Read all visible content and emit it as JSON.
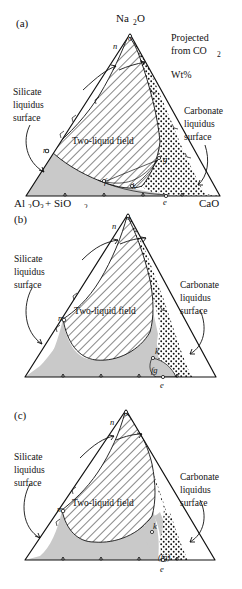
{
  "figure": {
    "type": "ternary-phase-diagram-series",
    "panel_count": 3
  },
  "notes": {
    "projected_line1": "Projected",
    "projected_line2": "from CO",
    "projected_sub": "2",
    "units": "Wt%"
  },
  "labels": {
    "silicate_l1": "Silicate",
    "silicate_l2": "liquidus",
    "silicate_l3": "surface",
    "carbonate_l1": "Carbonate",
    "carbonate_l2": "liquidus",
    "carbonate_l3": "surface",
    "two_liquid": "Two-liquid field"
  },
  "apex": {
    "top_main": "Na",
    "top_sub": "2",
    "top_tail": "O",
    "left_main": "Al",
    "left_sub1": "2",
    "left_mid": "O",
    "left_sub2": "3",
    "left_plus": "+ SiO",
    "left_sub3": "2",
    "right": "CaO"
  },
  "panels": [
    {
      "id": "a",
      "tag": "(a)",
      "has_apex_labels": true,
      "has_corner_labels": true,
      "has_notes": true,
      "points": [
        {
          "name": "o",
          "text": "o",
          "x": 128,
          "y": 41
        },
        {
          "name": "n",
          "text": "n",
          "x": 118,
          "y": 47
        },
        {
          "name": "m",
          "text": "m",
          "x": 47,
          "y": 151
        },
        {
          "name": "f",
          "text": "f",
          "x": 107,
          "y": 183
        },
        {
          "name": "g",
          "text": "g",
          "x": 164,
          "y": 163
        },
        {
          "name": "k",
          "text": "k",
          "x": 134,
          "y": 188
        },
        {
          "name": "e",
          "text": "e",
          "x": 165,
          "y": 198
        }
      ]
    },
    {
      "id": "b",
      "tag": "(b)",
      "has_apex_labels": false,
      "has_corner_labels": false,
      "has_notes": false,
      "points": [
        {
          "name": "o",
          "text": "o",
          "x": 126,
          "y": 20
        },
        {
          "name": "n",
          "text": "n",
          "x": 116,
          "y": 27
        },
        {
          "name": "m",
          "text": "m",
          "x": 63,
          "y": 119
        },
        {
          "name": "k",
          "text": "k",
          "x": 157,
          "y": 153
        },
        {
          "name": "fg",
          "text": "fg",
          "x": 156,
          "y": 172
        },
        {
          "name": "e",
          "text": "e",
          "x": 162,
          "y": 190
        }
      ]
    },
    {
      "id": "c",
      "tag": "(c)",
      "has_apex_labels": false,
      "has_corner_labels": false,
      "has_notes": false,
      "points": [
        {
          "name": "o",
          "text": "o",
          "x": 124,
          "y": 28
        },
        {
          "name": "n",
          "text": "n",
          "x": 114,
          "y": 35
        },
        {
          "name": "m",
          "text": "m",
          "x": 62,
          "y": 122
        },
        {
          "name": "k",
          "text": "k",
          "x": 155,
          "y": 140
        },
        {
          "name": "fg",
          "text": "(fg)",
          "x": 166,
          "y": 170
        },
        {
          "name": "e",
          "text": "e",
          "x": 162,
          "y": 185
        }
      ]
    }
  ],
  "colors": {
    "ink": "#111111",
    "paper": "#ffffff",
    "grey_field": "#c9c9c9",
    "light_grey": "#d8d8d8"
  }
}
